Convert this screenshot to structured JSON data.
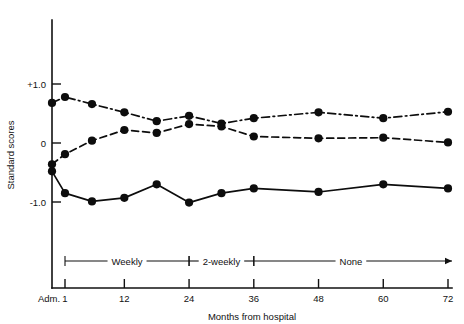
{
  "chart_data": {
    "type": "line",
    "title": "",
    "xlabel": "Months from hospital",
    "ylabel": "Standard scores",
    "x": [
      0,
      1,
      6,
      12,
      18,
      24,
      30,
      36,
      48,
      60,
      72
    ],
    "x_tick_values": [
      0,
      1,
      12,
      24,
      36,
      48,
      60,
      72
    ],
    "x_tick_labels": [
      "Adm.",
      "1",
      "12",
      "24",
      "36",
      "48",
      "60",
      "72"
    ],
    "y_tick_values": [
      1.0,
      0,
      -1.0
    ],
    "y_tick_labels": [
      "+1.0",
      "0",
      "-1.0"
    ],
    "ylim": [
      -1.45,
      1.45
    ],
    "xlim": [
      -1.5,
      74
    ],
    "grid": false,
    "legend": "none",
    "series": [
      {
        "name": "series-dash-dot",
        "linestyle": "dash-dot",
        "marker": "filled-circle",
        "color": "#0d0d0d",
        "x": [
          0,
          1,
          6,
          12,
          18,
          24,
          30,
          36,
          48,
          60,
          72
        ],
        "values": [
          0.68,
          0.78,
          0.66,
          0.52,
          0.37,
          0.46,
          0.33,
          0.42,
          0.52,
          0.42,
          0.53
        ]
      },
      {
        "name": "series-dashed",
        "linestyle": "dashed",
        "marker": "filled-circle",
        "color": "#0d0d0d",
        "x": [
          0,
          1,
          6,
          12,
          18,
          24,
          30,
          36,
          48,
          60,
          72
        ],
        "values": [
          -0.36,
          -0.19,
          0.04,
          0.22,
          0.17,
          0.32,
          0.28,
          0.11,
          0.08,
          0.09,
          0.01
        ]
      },
      {
        "name": "series-solid",
        "linestyle": "solid",
        "marker": "filled-circle",
        "color": "#0d0d0d",
        "x": [
          0,
          1,
          6,
          12,
          18,
          24,
          30,
          36,
          48,
          60,
          72
        ],
        "values": [
          -0.48,
          -0.85,
          -0.99,
          -0.93,
          -0.7,
          -1.01,
          -0.85,
          -0.77,
          -0.83,
          -0.7,
          -0.77
        ]
      }
    ],
    "annotations": {
      "band_label_weekly": "Weekly",
      "band_label_2weekly": "2-weekly",
      "band_label_none": "None",
      "band_ranges": [
        {
          "label": "Weekly",
          "from_month": 1,
          "to_month": 24
        },
        {
          "label": "2-weekly",
          "from_month": 24,
          "to_month": 36
        },
        {
          "label": "None",
          "from_month": 36,
          "to_month": 72,
          "arrow_end": true
        }
      ]
    }
  },
  "colors": {
    "ink": "#0d0d0d",
    "axis": "#111111",
    "background": "#ffffff"
  }
}
